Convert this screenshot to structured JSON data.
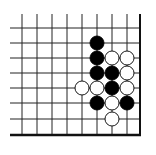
{
  "board": {
    "description": "Go problem diagram, lower-right corner",
    "line_color": "#222222",
    "edge_color": "#111111",
    "background": "#ffffff",
    "columns_x": [
      22,
      37,
      52,
      67,
      82,
      97,
      112,
      127
    ],
    "rows_y": [
      28,
      43,
      58,
      73,
      88,
      103,
      119
    ],
    "left_x": 10,
    "top_y": 14,
    "right_edge_x": 140,
    "bottom_edge_y": 135,
    "stone_radius": 7
  },
  "stones": [
    {
      "color": "black",
      "x": 97,
      "y": 43
    },
    {
      "color": "black",
      "x": 97,
      "y": 58
    },
    {
      "color": "white",
      "x": 112,
      "y": 58
    },
    {
      "color": "white",
      "x": 127,
      "y": 58
    },
    {
      "color": "black",
      "x": 97,
      "y": 73
    },
    {
      "color": "black",
      "x": 112,
      "y": 73
    },
    {
      "color": "white",
      "x": 127,
      "y": 73
    },
    {
      "color": "white",
      "x": 82,
      "y": 88
    },
    {
      "color": "white",
      "x": 97,
      "y": 88
    },
    {
      "color": "black",
      "x": 112,
      "y": 88
    },
    {
      "color": "white",
      "x": 127,
      "y": 88
    },
    {
      "color": "black",
      "x": 97,
      "y": 103
    },
    {
      "color": "white",
      "x": 112,
      "y": 103
    },
    {
      "color": "black",
      "x": 127,
      "y": 103
    },
    {
      "color": "white",
      "x": 112,
      "y": 119
    }
  ]
}
